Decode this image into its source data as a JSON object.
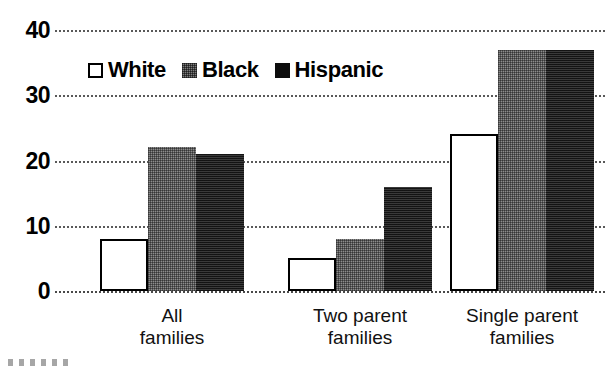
{
  "chart_data": {
    "type": "bar",
    "title": "",
    "xlabel": "",
    "ylabel": "",
    "ylim": [
      0,
      40
    ],
    "yticks": [
      0,
      10,
      20,
      30,
      40
    ],
    "grid": true,
    "legend_position": "inside-top-left",
    "categories": [
      "All families",
      "Two parent families",
      "Single parent families"
    ],
    "category_lines": [
      [
        "All",
        "families"
      ],
      [
        "Two parent",
        "families"
      ],
      [
        "Single parent",
        "families"
      ]
    ],
    "series": [
      {
        "name": "White",
        "values": [
          8,
          5,
          24
        ],
        "color": "#ffffff",
        "style": "open-square-black-border"
      },
      {
        "name": "Black",
        "values": [
          22,
          8,
          37
        ],
        "color": "#8c8c8c",
        "style": "gray-hatched"
      },
      {
        "name": "Hispanic",
        "values": [
          21,
          16,
          37
        ],
        "color": "#2b2b2b",
        "style": "solid-dark"
      }
    ]
  },
  "legend": {
    "items": [
      {
        "label": "White",
        "swatch": "open-square-icon"
      },
      {
        "label": "Black",
        "swatch": "hatched-square-icon"
      },
      {
        "label": "Hispanic",
        "swatch": "filled-square-icon"
      }
    ]
  },
  "axis": {
    "y_tick_labels": [
      "40",
      "30",
      "20",
      "10",
      "0"
    ]
  }
}
